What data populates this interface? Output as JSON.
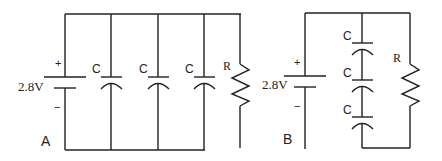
{
  "circuit_a": {
    "label": "A",
    "battery": {
      "voltage": "2.8V",
      "plus": "+",
      "minus": "−"
    },
    "capacitors": [
      {
        "label": "C"
      },
      {
        "label": "C"
      },
      {
        "label": "C"
      }
    ],
    "resistor": {
      "label": "R"
    },
    "arrangement": "three capacitors and resistor in parallel with battery"
  },
  "circuit_b": {
    "label": "B",
    "battery": {
      "voltage": "2.8V",
      "plus": "+",
      "minus": "−"
    },
    "capacitors": [
      {
        "label": "C"
      },
      {
        "label": "C"
      },
      {
        "label": "C"
      }
    ],
    "resistor": {
      "label": "R"
    },
    "arrangement": "three capacitors in series, in parallel with resistor and battery"
  },
  "colors": {
    "line": "#222222",
    "background": "#ffffff"
  }
}
